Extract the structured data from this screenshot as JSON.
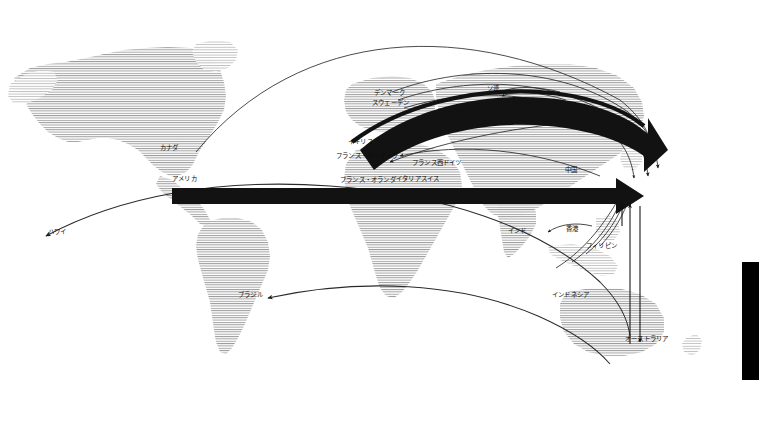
{
  "figure": {
    "kind": "world-flow-map",
    "language": "ja",
    "background_color": "#ffffff",
    "land_color": "#b9b9b9",
    "flow_color": "#111111",
    "thin_line_color": "#2a2a2a"
  },
  "labels": {
    "canada": "カナダ",
    "usa": "アメリカ",
    "hawaii": "ハワイ",
    "brazil": "ブラジル",
    "denmark": "デンマーク",
    "sweden": "スウェーデン",
    "uk": "イギリス",
    "france_denmark": "フランス・デンマーク",
    "france_westgermany": "フランス西ドイツ",
    "france_netherlands": "フランス・オランダ",
    "italy_switzerland": "イタリアスイス",
    "soviet_union": "ソ連",
    "china": "中国",
    "india": "インド",
    "hongkong": "香港",
    "philippines": "フィリピン",
    "indonesia": "インドネシア",
    "australia": "オーストラリア"
  },
  "flows": {
    "thick_bands": [
      {
        "id": "band-denmark-sweden",
        "from": "デンマーク / スウェーデン",
        "to": "ソ連",
        "weight": "thin-band"
      },
      {
        "id": "band-uk",
        "from": "イギリス",
        "to": "中国",
        "weight": "heavy-band"
      },
      {
        "id": "band-usa-east",
        "from": "アメリカ",
        "to": "中国",
        "weight": "heavy-straight"
      }
    ],
    "thin_arcs": [
      {
        "id": "arc-canada",
        "from": "カナダ",
        "to": "ソ連"
      },
      {
        "id": "arc-hawaii",
        "from": "ハワイ",
        "to": "インドネシア"
      },
      {
        "id": "arc-brazil",
        "from": "ブラジル",
        "to": "インドネシア"
      },
      {
        "id": "arc-india",
        "from": "インド",
        "to": "香港"
      },
      {
        "id": "arc-philippines",
        "from": "フィリピン",
        "to": "中国"
      },
      {
        "id": "arc-france-nl",
        "from": "フランス・オランダ",
        "to": "中国"
      },
      {
        "id": "arc-italy-ch",
        "from": "イタリアスイス",
        "to": "中国"
      }
    ],
    "vertical_arrows": [
      {
        "id": "arrow-australia-a",
        "between": [
          "オーストラリア",
          "中国"
        ]
      },
      {
        "id": "arrow-australia-b",
        "between": [
          "オーストラリア",
          "中国"
        ]
      }
    ]
  },
  "right_bar": {
    "color": "#000000"
  }
}
